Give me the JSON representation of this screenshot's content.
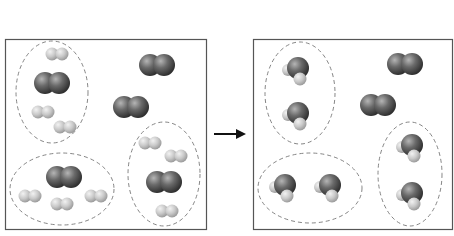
{
  "diagram": {
    "colors": {
      "background": "#ffffff",
      "box_border": "#555555",
      "dashed_circle": "#777777",
      "oxygen_dark": "#3c3c3c",
      "oxygen_light": "#a8a8a8",
      "hydrogen_dark": "#a9a9a9",
      "hydrogen_light": "#e6e6e6",
      "arrow": "#111111"
    },
    "arrow": {
      "label": "",
      "x1": 214,
      "x2": 246,
      "y": 134
    },
    "panels": [
      {
        "name": "reactants",
        "box": {
          "x": 5,
          "y": 39,
          "w": 201,
          "h": 190
        },
        "groups": [
          {
            "ellipse": {
              "cx": 52,
              "cy": 92,
              "rx": 36,
              "ry": 51
            },
            "molecules": [
              {
                "type": "H2",
                "x": 57,
                "y": 54
              },
              {
                "type": "O2",
                "x": 52,
                "y": 83
              },
              {
                "type": "H2",
                "x": 43,
                "y": 112
              },
              {
                "type": "H2",
                "x": 65,
                "y": 127
              }
            ]
          },
          {
            "ellipse": {
              "cx": 62,
              "cy": 189,
              "rx": 52,
              "ry": 36
            },
            "molecules": [
              {
                "type": "O2",
                "x": 64,
                "y": 177
              },
              {
                "type": "H2",
                "x": 30,
                "y": 196
              },
              {
                "type": "H2",
                "x": 62,
                "y": 204
              },
              {
                "type": "H2",
                "x": 96,
                "y": 196
              }
            ]
          },
          {
            "ellipse": {
              "cx": 164,
              "cy": 174,
              "rx": 36,
              "ry": 52
            },
            "molecules": [
              {
                "type": "H2",
                "x": 150,
                "y": 143
              },
              {
                "type": "H2",
                "x": 176,
                "y": 156
              },
              {
                "type": "O2",
                "x": 164,
                "y": 182
              },
              {
                "type": "H2",
                "x": 167,
                "y": 211
              }
            ]
          }
        ],
        "free_molecules": [
          {
            "type": "O2",
            "x": 157,
            "y": 65
          },
          {
            "type": "O2",
            "x": 131,
            "y": 107
          }
        ]
      },
      {
        "name": "products",
        "box": {
          "x": 253,
          "y": 39,
          "w": 199,
          "h": 190
        },
        "groups": [
          {
            "ellipse": {
              "cx": 300,
              "cy": 93,
              "rx": 35,
              "ry": 51
            },
            "molecules": [
              {
                "type": "H2O",
                "x": 298,
                "y": 68
              },
              {
                "type": "H2O",
                "x": 298,
                "y": 113
              }
            ]
          },
          {
            "ellipse": {
              "cx": 310,
              "cy": 188,
              "rx": 52,
              "ry": 35
            },
            "molecules": [
              {
                "type": "H2O",
                "x": 285,
                "y": 185
              },
              {
                "type": "H2O",
                "x": 330,
                "y": 185
              }
            ]
          },
          {
            "ellipse": {
              "cx": 410,
              "cy": 174,
              "rx": 32,
              "ry": 52
            },
            "molecules": [
              {
                "type": "H2O",
                "x": 412,
                "y": 145
              },
              {
                "type": "H2O",
                "x": 412,
                "y": 193
              }
            ]
          }
        ],
        "free_molecules": [
          {
            "type": "O2",
            "x": 405,
            "y": 64
          },
          {
            "type": "O2",
            "x": 378,
            "y": 105
          }
        ]
      }
    ],
    "counts": {
      "reactants": {
        "O2": 5,
        "H2": 10
      },
      "products": {
        "H2O": 6,
        "O2": 2
      }
    }
  }
}
